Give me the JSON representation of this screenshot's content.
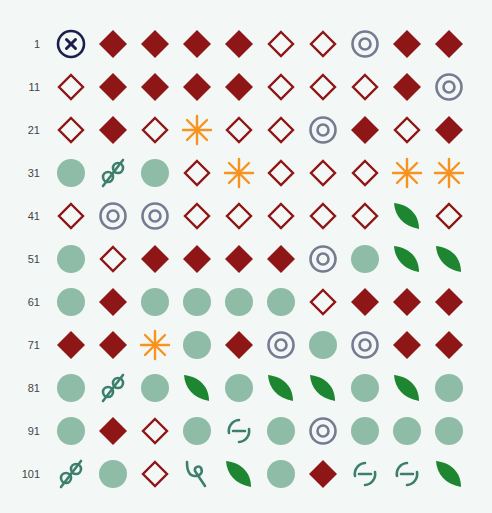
{
  "colors": {
    "background": "#f3f8f7",
    "red": "#8e1616",
    "gray_target": "#777a92",
    "navy_x": "#1c1f4a",
    "orange": "#f7931e",
    "sage": "#8fbca6",
    "teal_glyph": "#3d7f6c",
    "green_leaf": "#1e8530",
    "label": "#444444"
  },
  "grid": {
    "columns": 10,
    "origin_x": 71,
    "origin_y": 44,
    "col_spacing": 42,
    "row_spacing": 43,
    "rows": [
      {
        "label": "1",
        "icons": [
          "circle-x",
          "diamond-filled",
          "diamond-filled",
          "diamond-filled",
          "diamond-filled",
          "diamond-outline",
          "diamond-outline",
          "target",
          "diamond-filled",
          "diamond-filled"
        ]
      },
      {
        "label": "11",
        "icons": [
          "diamond-outline",
          "diamond-filled",
          "diamond-filled",
          "diamond-filled",
          "diamond-filled",
          "diamond-outline",
          "diamond-outline",
          "diamond-outline",
          "diamond-filled",
          "target"
        ]
      },
      {
        "label": "21",
        "icons": [
          "diamond-outline",
          "diamond-filled",
          "diamond-outline",
          "asterisk",
          "diamond-outline",
          "diamond-outline",
          "target",
          "diamond-filled",
          "diamond-outline",
          "diamond-filled"
        ]
      },
      {
        "label": "31",
        "icons": [
          "sage-dot",
          "loop-glyph",
          "sage-dot",
          "diamond-outline",
          "asterisk",
          "diamond-outline",
          "diamond-outline",
          "diamond-outline",
          "asterisk",
          "asterisk"
        ]
      },
      {
        "label": "41",
        "icons": [
          "diamond-outline",
          "target",
          "target",
          "diamond-outline",
          "diamond-outline",
          "diamond-outline",
          "diamond-outline",
          "diamond-outline",
          "leaf",
          "diamond-outline"
        ]
      },
      {
        "label": "51",
        "icons": [
          "sage-dot",
          "diamond-outline",
          "diamond-filled",
          "diamond-filled",
          "diamond-filled",
          "diamond-filled",
          "target",
          "sage-dot",
          "leaf",
          "leaf"
        ]
      },
      {
        "label": "61",
        "icons": [
          "sage-dot",
          "diamond-filled",
          "sage-dot",
          "sage-dot",
          "sage-dot",
          "sage-dot",
          "diamond-outline",
          "diamond-filled",
          "diamond-filled",
          "diamond-filled"
        ]
      },
      {
        "label": "71",
        "icons": [
          "diamond-filled",
          "diamond-filled",
          "asterisk",
          "sage-dot",
          "diamond-filled",
          "target",
          "sage-dot",
          "target",
          "diamond-filled",
          "diamond-filled"
        ]
      },
      {
        "label": "81",
        "icons": [
          "sage-dot",
          "loop-glyph",
          "sage-dot",
          "leaf",
          "sage-dot",
          "leaf",
          "leaf",
          "sage-dot",
          "leaf",
          "sage-dot"
        ]
      },
      {
        "label": "91",
        "icons": [
          "sage-dot",
          "diamond-filled",
          "diamond-outline",
          "sage-dot",
          "dashed-circle",
          "sage-dot",
          "target",
          "sage-dot",
          "sage-dot",
          "sage-dot"
        ]
      },
      {
        "label": "101",
        "icons": [
          "loop-glyph",
          "sage-dot",
          "diamond-outline",
          "hook-glyph",
          "leaf",
          "sage-dot",
          "diamond-filled",
          "dashed-circle",
          "dashed-circle",
          "leaf"
        ]
      }
    ]
  }
}
